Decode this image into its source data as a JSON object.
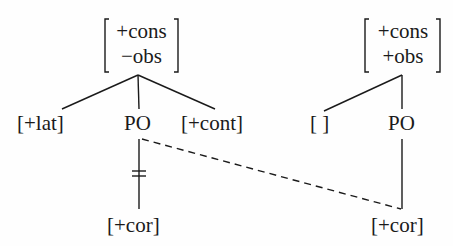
{
  "diagram": {
    "type": "phonological feature geometry",
    "left_tree": {
      "root": {
        "features": [
          "+cons",
          "−obs"
        ]
      },
      "children": [
        {
          "label": "[+lat]"
        },
        {
          "label": "PO"
        },
        {
          "label": "[+cont]"
        }
      ],
      "po_dependent": {
        "label": "[+cor]",
        "link": "delinked (crossed by double bar)"
      }
    },
    "right_tree": {
      "root": {
        "features": [
          "+cons",
          "+obs"
        ]
      },
      "children": [
        {
          "label": "[ ]"
        },
        {
          "label": "PO"
        }
      ],
      "po_dependent": {
        "label": "[+cor]",
        "link": "associated"
      }
    },
    "spreading_link": {
      "from": "left PO",
      "to": "right [+cor]",
      "style": "dashed"
    },
    "colors": {
      "ink": "#1a1a1a",
      "background": "#fefefe"
    }
  }
}
